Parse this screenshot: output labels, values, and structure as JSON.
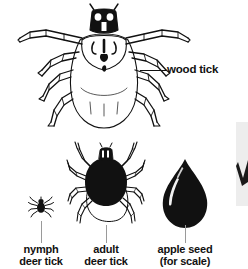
{
  "figure": {
    "background_color": "#ffffff",
    "ink_color": "#111111",
    "leader_color": "#9a9a9a"
  },
  "specimens": [
    {
      "id": "wood-tick",
      "icon": "wood-tick-icon",
      "caption_lines": [
        "wood tick"
      ],
      "leader": "horizontal"
    },
    {
      "id": "nymph-deer-tick",
      "icon": "nymph-deer-tick-icon",
      "caption_lines": [
        "nymph",
        "deer tick"
      ],
      "leader": "vertical"
    },
    {
      "id": "adult-deer-tick",
      "icon": "adult-deer-tick-icon",
      "caption_lines": [
        "adult",
        "deer tick"
      ],
      "leader": "vertical"
    },
    {
      "id": "apple-seed",
      "icon": "apple-seed-icon",
      "caption_lines": [
        "apple seed",
        "(for scale)"
      ],
      "leader": "vertical"
    }
  ],
  "captions": {
    "wood_tick": "wood tick",
    "nymph_line1": "nymph",
    "nymph_line2": "deer tick",
    "adult_line1": "adult",
    "adult_line2": "deer tick",
    "seed_line1": "apple seed",
    "seed_line2": "(for scale)"
  },
  "edge_artifact": {
    "name": "cropped-adjacent-graphic",
    "panel_color": "#ededed",
    "shape_color": "#1a1a1a"
  }
}
